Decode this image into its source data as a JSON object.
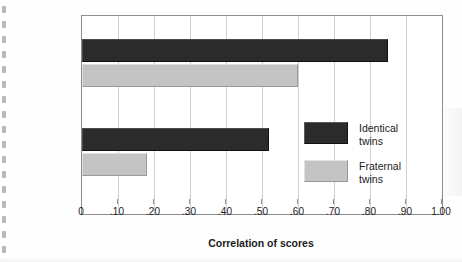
{
  "chart_data": {
    "type": "bar",
    "orientation": "horizontal",
    "title": "",
    "xlabel": "Correlation of scores",
    "ylabel": "",
    "xlim": [
      0,
      1.0
    ],
    "grid": true,
    "legend_position": "inside-right",
    "categories": [
      {
        "main": "Intelligence",
        "sub": ""
      },
      {
        "main": "Personality",
        "sub": "(extraversion)"
      }
    ],
    "series": [
      {
        "name": "Identical twins",
        "name_line1": "Identical",
        "name_line2": "twins",
        "color": "#2b2b2b",
        "values": [
          0.85,
          0.52
        ]
      },
      {
        "name": "Fraternal twins",
        "name_line1": "Fraternal",
        "name_line2": "twins",
        "color": "#c4c4c4",
        "values": [
          0.6,
          0.18
        ]
      }
    ],
    "xticks": [
      {
        "value": 0.0,
        "label": "0"
      },
      {
        "value": 0.1,
        "label": ".10"
      },
      {
        "value": 0.2,
        "label": ".20"
      },
      {
        "value": 0.3,
        "label": ".30"
      },
      {
        "value": 0.4,
        "label": ".40"
      },
      {
        "value": 0.5,
        "label": ".50"
      },
      {
        "value": 0.6,
        "label": ".60"
      },
      {
        "value": 0.7,
        "label": ".70"
      },
      {
        "value": 0.8,
        "label": ".80"
      },
      {
        "value": 0.9,
        "label": ".90"
      },
      {
        "value": 1.0,
        "label": "1.00"
      }
    ]
  }
}
